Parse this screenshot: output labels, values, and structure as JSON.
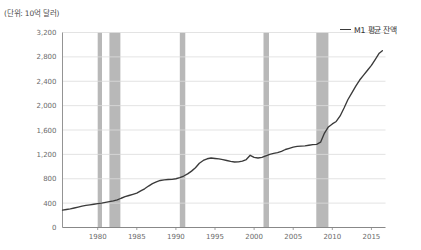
{
  "unit_label": "(단위: 10억 달러)",
  "legend": {
    "swatch_name": "line-swatch",
    "label": "M1 평균 잔액"
  },
  "colors": {
    "line": "#3a3a3a",
    "recession_band": "#b8b8b8",
    "gridline": "#dcdcdc",
    "axis": "#888888",
    "tick_text": "#6b6b6b",
    "background": "#ffffff"
  },
  "chart_data": {
    "type": "line",
    "title": "",
    "subtitle": "",
    "xlabel": "",
    "ylabel": "(단위: 10억 달러)",
    "grid": true,
    "legend_position": "top-right",
    "xlim": [
      1975.5,
      2016.8
    ],
    "ylim": [
      0,
      3200
    ],
    "yticks": [
      0,
      400,
      800,
      1200,
      1600,
      2000,
      2400,
      2800,
      3200
    ],
    "ytick_labels": [
      "0",
      "400",
      "800",
      "1,200",
      "1,600",
      "2,000",
      "2,400",
      "2,800",
      "3,200"
    ],
    "xticks": [
      1980,
      1985,
      1990,
      1995,
      2000,
      2005,
      2010,
      2015
    ],
    "xtick_labels": [
      "1980",
      "1985",
      "1990",
      "1995",
      "2000",
      "2005",
      "2010",
      "2015"
    ],
    "series": [
      {
        "name": "M1 평균 잔액",
        "color": "#3a3a3a",
        "x": [
          1975.5,
          1976,
          1976.5,
          1977,
          1977.5,
          1978,
          1978.5,
          1979,
          1979.5,
          1980,
          1980.5,
          1981,
          1981.5,
          1982,
          1982.5,
          1983,
          1983.5,
          1984,
          1984.5,
          1985,
          1985.5,
          1986,
          1986.5,
          1987,
          1987.5,
          1988,
          1988.5,
          1989,
          1989.5,
          1990,
          1990.5,
          1991,
          1991.5,
          1992,
          1992.5,
          1993,
          1993.5,
          1994,
          1994.5,
          1995,
          1995.5,
          1996,
          1996.5,
          1997,
          1997.5,
          1998,
          1998.5,
          1999,
          1999.5,
          2000,
          2000.5,
          2001,
          2001.5,
          2002,
          2002.5,
          2003,
          2003.5,
          2004,
          2004.5,
          2005,
          2005.5,
          2006,
          2006.5,
          2007,
          2007.5,
          2008,
          2008.5,
          2009,
          2009.5,
          2010,
          2010.5,
          2011,
          2011.5,
          2012,
          2012.5,
          2013,
          2013.5,
          2014,
          2014.5,
          2015,
          2015.5,
          2016,
          2016.4
        ],
        "y": [
          285,
          295,
          305,
          320,
          335,
          350,
          362,
          372,
          382,
          392,
          400,
          412,
          424,
          436,
          452,
          480,
          505,
          525,
          545,
          565,
          600,
          635,
          680,
          720,
          748,
          772,
          782,
          788,
          790,
          800,
          818,
          845,
          880,
          925,
          980,
          1055,
          1100,
          1128,
          1140,
          1132,
          1125,
          1115,
          1100,
          1085,
          1075,
          1078,
          1090,
          1115,
          1185,
          1150,
          1140,
          1150,
          1175,
          1200,
          1215,
          1228,
          1250,
          1280,
          1300,
          1320,
          1330,
          1335,
          1340,
          1350,
          1360,
          1365,
          1400,
          1550,
          1650,
          1700,
          1740,
          1830,
          1960,
          2100,
          2210,
          2320,
          2420,
          2500,
          2580,
          2660,
          2760,
          2860,
          2900
        ]
      }
    ],
    "recession_bands": [
      {
        "name": "1980",
        "start": 1980.0,
        "end": 1980.55
      },
      {
        "name": "1981-1982",
        "start": 1981.5,
        "end": 1982.9
      },
      {
        "name": "1990-1991",
        "start": 1990.5,
        "end": 1991.2
      },
      {
        "name": "2001",
        "start": 2001.2,
        "end": 2001.9
      },
      {
        "name": "2008-2009",
        "start": 2007.95,
        "end": 2009.5
      }
    ]
  }
}
